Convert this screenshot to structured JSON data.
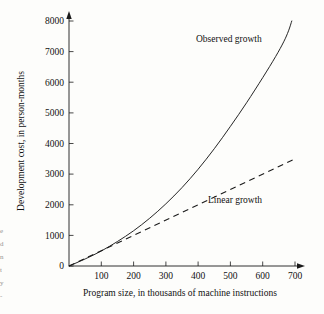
{
  "figure": {
    "background_color": "#fdfdfb",
    "ink_color": "#1a1a1a"
  },
  "chart_data": {
    "type": "line",
    "title": "",
    "xlabel": "Program size, in thousands of machine instructions",
    "ylabel": "Development cost, in person-months",
    "xlim": [
      0,
      730
    ],
    "ylim": [
      0,
      8300
    ],
    "grid": false,
    "legend_position": "inline-annotations",
    "xticks": [
      100,
      200,
      300,
      400,
      500,
      600,
      700
    ],
    "xtick_labels": [
      "100",
      "200",
      "300",
      "400",
      "500",
      "600",
      "700"
    ],
    "yticks": [
      0,
      1000,
      2000,
      3000,
      4000,
      5000,
      6000,
      7000,
      8000
    ],
    "ytick_labels": [
      "0",
      "1000",
      "2000",
      "3000",
      "4000",
      "5000",
      "6000",
      "7000",
      "8000"
    ],
    "series": [
      {
        "name": "Observed growth",
        "style": "solid",
        "label": "Observed growth",
        "x": [
          0,
          50,
          100,
          150,
          200,
          250,
          300,
          350,
          400,
          450,
          500,
          550,
          600,
          640,
          665,
          680,
          690
        ],
        "y": [
          0,
          230,
          490,
          800,
          1150,
          1560,
          2030,
          2560,
          3160,
          3830,
          4560,
          5330,
          6150,
          6840,
          7320,
          7680,
          8000
        ]
      },
      {
        "name": "Linear growth",
        "style": "dashed",
        "label": "Linear growth",
        "x": [
          0,
          700
        ],
        "y": [
          0,
          3500
        ]
      }
    ],
    "annotations": [
      {
        "text": "Observed growth",
        "x": 530,
        "y": 7430
      },
      {
        "text": "Linear growth",
        "x": 555,
        "y": 2480
      }
    ]
  },
  "margin_fragments": [
    "e",
    "d",
    "n",
    "t",
    "y",
    "-"
  ]
}
